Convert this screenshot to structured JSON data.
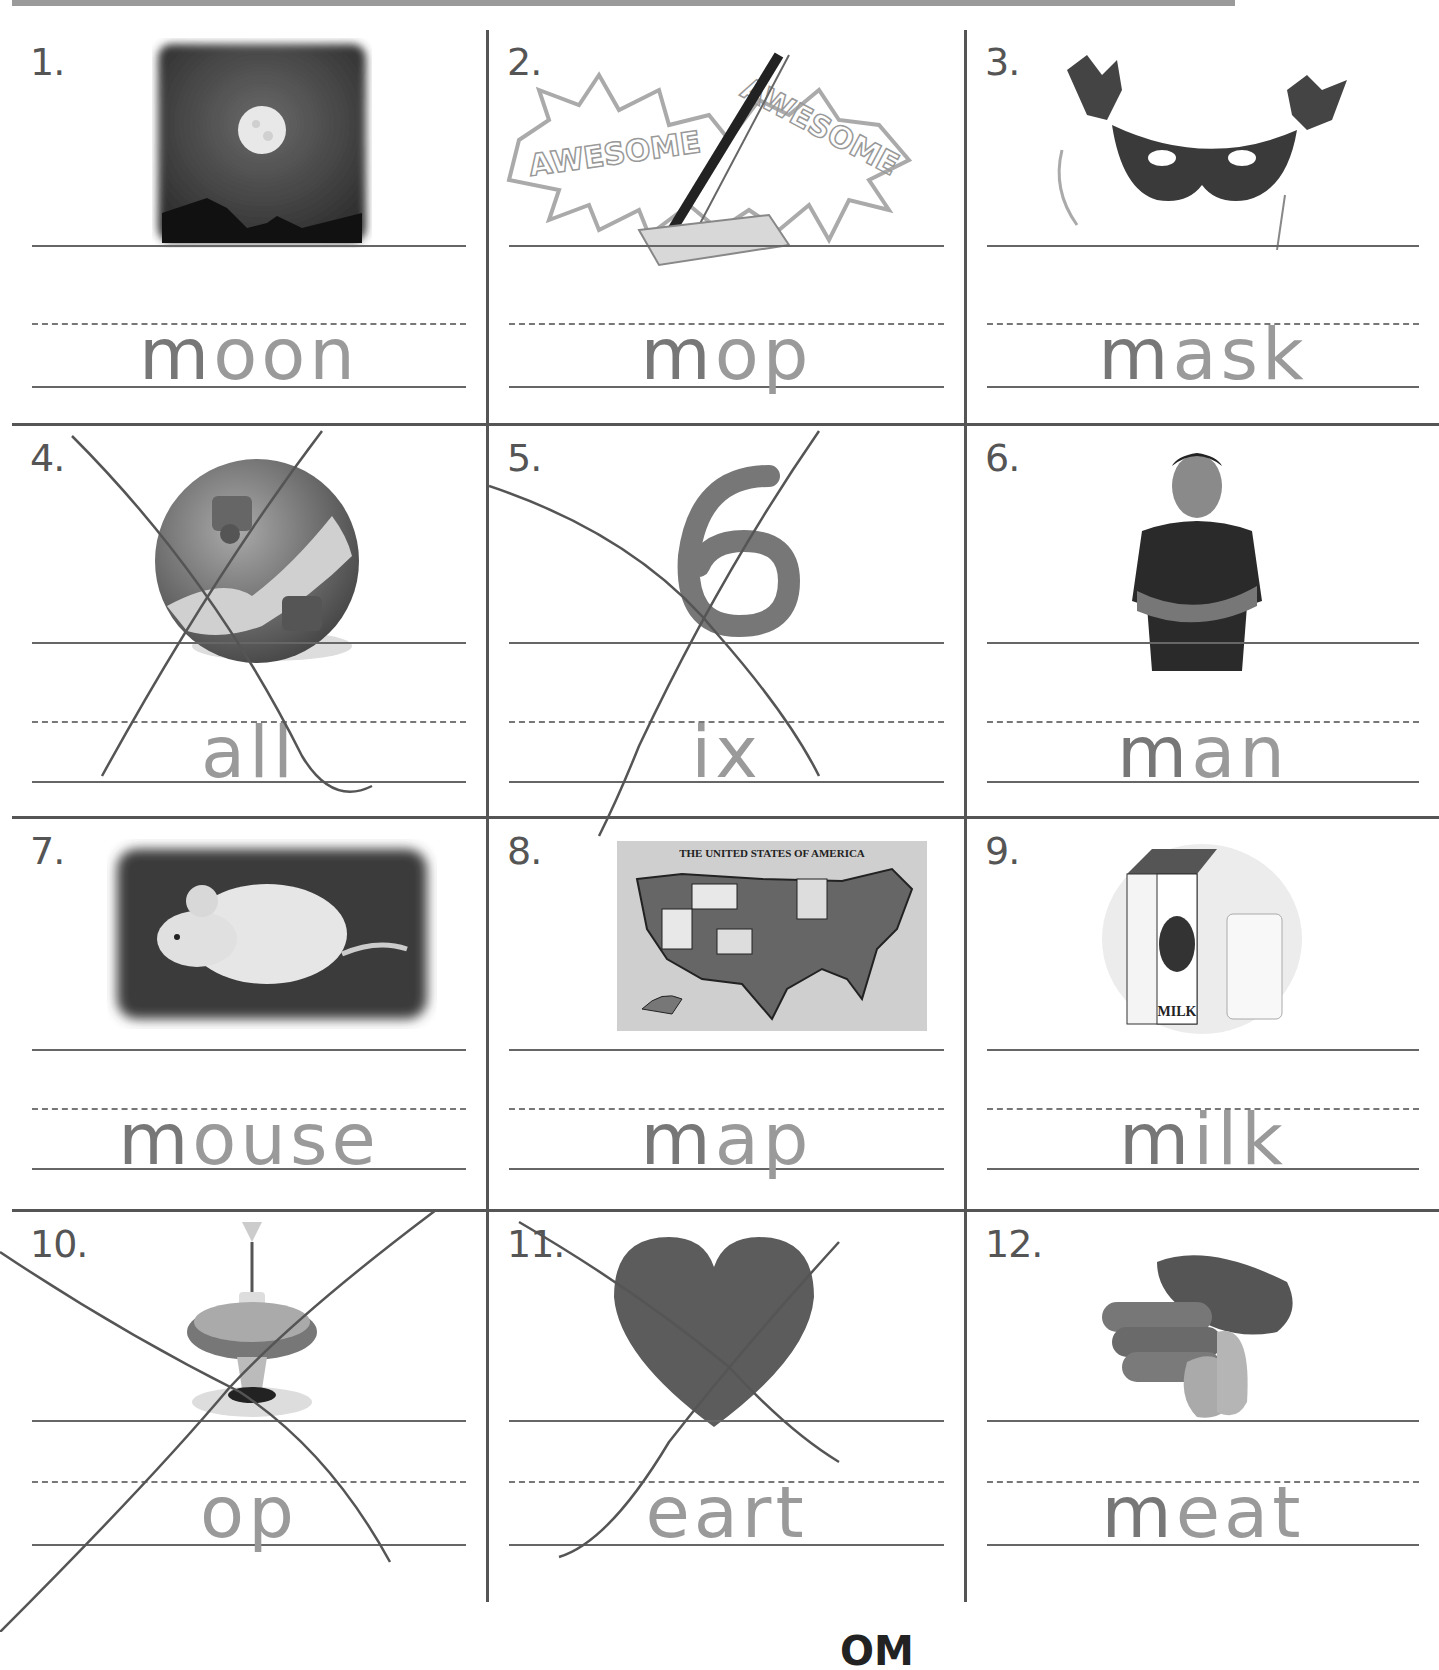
{
  "worksheet": {
    "items": [
      {
        "number": "1.",
        "picture": "moon-photo",
        "prefix": "m",
        "letters": "oon",
        "crossed_out": false
      },
      {
        "number": "2.",
        "picture": "mop-photo",
        "prefix": "m",
        "letters": "op",
        "crossed_out": false
      },
      {
        "number": "3.",
        "picture": "mask-photo",
        "prefix": "m",
        "letters": "ask",
        "crossed_out": false
      },
      {
        "number": "4.",
        "picture": "ball-photo",
        "prefix": "",
        "letters": "all",
        "crossed_out": true
      },
      {
        "number": "5.",
        "picture": "six-photo",
        "prefix": "",
        "letters": "ix",
        "crossed_out": true
      },
      {
        "number": "6.",
        "picture": "man-photo",
        "prefix": "m",
        "letters": "an",
        "crossed_out": false
      },
      {
        "number": "7.",
        "picture": "mouse-photo",
        "prefix": "m",
        "letters": "ouse",
        "crossed_out": false
      },
      {
        "number": "8.",
        "picture": "map-photo",
        "prefix": "m",
        "letters": "ap",
        "crossed_out": false,
        "caption": "THE UNITED STATES OF AMERICA"
      },
      {
        "number": "9.",
        "picture": "milk-photo",
        "prefix": "m",
        "letters": "ilk",
        "crossed_out": false,
        "caption": "MILK"
      },
      {
        "number": "10.",
        "picture": "top-photo",
        "prefix": "",
        "letters": "op",
        "crossed_out": true
      },
      {
        "number": "11.",
        "picture": "heart-photo",
        "prefix": "",
        "letters": "eart",
        "crossed_out": true
      },
      {
        "number": "12.",
        "picture": "meat-photo",
        "prefix": "m",
        "letters": "eat",
        "crossed_out": false
      }
    ],
    "stamp_text": "AWESOME"
  },
  "footer": {
    "fragment": "OM"
  }
}
